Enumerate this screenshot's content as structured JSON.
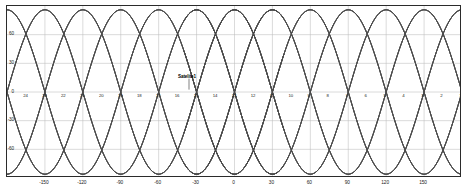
{
  "chart_data": {
    "type": "line",
    "title": "",
    "xlabel": "",
    "ylabel": "",
    "xlim": [
      -180,
      180
    ],
    "ylim": [
      -90,
      90
    ],
    "grid": true,
    "legend": "none",
    "x_ticks": [
      "-150",
      "-120",
      "-90",
      "-60",
      "-30",
      "0",
      "30",
      "60",
      "90",
      "120",
      "150"
    ],
    "x_tick_values": [
      -150,
      -120,
      -90,
      -60,
      -30,
      0,
      30,
      60,
      90,
      120,
      150
    ],
    "y_ticks": [
      "60",
      "30",
      "0",
      "-30",
      "-60"
    ],
    "y_tick_values": [
      60,
      30,
      0,
      -30,
      -60
    ],
    "series_description": "Satellite ground tracks: sinusoidal longitude-latitude traces of a walker constellation, amplitude 86 degrees latitude, ground-track period 360/12 degrees longitude per revolution",
    "series": [
      {
        "name": "track-1",
        "phase_deg": -180,
        "amplitude_deg": 86,
        "period_deg": 120,
        "direction": "ascending"
      },
      {
        "name": "track-2",
        "phase_deg": -150,
        "amplitude_deg": 86,
        "period_deg": 120,
        "direction": "ascending"
      },
      {
        "name": "track-3",
        "phase_deg": -120,
        "amplitude_deg": 86,
        "period_deg": 120,
        "direction": "ascending"
      },
      {
        "name": "track-4",
        "phase_deg": -90,
        "amplitude_deg": 86,
        "period_deg": 120,
        "direction": "ascending"
      },
      {
        "name": "track-5",
        "phase_deg": -60,
        "amplitude_deg": 86,
        "period_deg": 120,
        "direction": "ascending"
      },
      {
        "name": "track-6",
        "phase_deg": -30,
        "amplitude_deg": 86,
        "period_deg": 120,
        "direction": "ascending"
      },
      {
        "name": "track-7",
        "phase_deg": 0,
        "amplitude_deg": 86,
        "period_deg": 120,
        "direction": "ascending"
      },
      {
        "name": "track-8",
        "phase_deg": 30,
        "amplitude_deg": 86,
        "period_deg": 120,
        "direction": "ascending"
      },
      {
        "name": "track-9",
        "phase_deg": 60,
        "amplitude_deg": 86,
        "period_deg": 120,
        "direction": "ascending"
      },
      {
        "name": "track-10",
        "phase_deg": 90,
        "amplitude_deg": 86,
        "period_deg": 120,
        "direction": "ascending"
      },
      {
        "name": "track-11",
        "phase_deg": 120,
        "amplitude_deg": 86,
        "period_deg": 120,
        "direction": "ascending"
      },
      {
        "name": "track-12",
        "phase_deg": 150,
        "amplitude_deg": 86,
        "period_deg": 120,
        "direction": "ascending"
      }
    ],
    "satellite_markers": [
      {
        "label": "24",
        "x": -168,
        "y": 0
      },
      {
        "label": "23",
        "x": -153,
        "y": 0
      },
      {
        "label": "22",
        "x": -138,
        "y": 0
      },
      {
        "label": "21",
        "x": -123,
        "y": 0
      },
      {
        "label": "20",
        "x": -108,
        "y": 0
      },
      {
        "label": "19",
        "x": -93,
        "y": 0
      },
      {
        "label": "18",
        "x": -78,
        "y": 0
      },
      {
        "label": "17",
        "x": -63,
        "y": 0
      },
      {
        "label": "16",
        "x": -48,
        "y": 0
      },
      {
        "label": "15",
        "x": -33,
        "y": 0
      },
      {
        "label": "14",
        "x": -18,
        "y": 0
      },
      {
        "label": "13",
        "x": -3,
        "y": 0
      },
      {
        "label": "12",
        "x": 12,
        "y": 0
      },
      {
        "label": "11",
        "x": 27,
        "y": 0
      },
      {
        "label": "10",
        "x": 42,
        "y": 0
      },
      {
        "label": "9",
        "x": 57,
        "y": 0
      },
      {
        "label": "8",
        "x": 72,
        "y": 0
      },
      {
        "label": "7",
        "x": 87,
        "y": 0
      },
      {
        "label": "6",
        "x": 102,
        "y": 0
      },
      {
        "label": "5",
        "x": 117,
        "y": 0
      },
      {
        "label": "4",
        "x": 132,
        "y": 0
      },
      {
        "label": "3",
        "x": 147,
        "y": 0
      },
      {
        "label": "2",
        "x": 162,
        "y": 0
      },
      {
        "label": "1",
        "x": 177,
        "y": 0
      }
    ],
    "annotations": [
      {
        "name": "satellite-callout",
        "text": "Satelite1",
        "x": -36,
        "y": 14
      }
    ]
  },
  "colors": {
    "frame": "#2b2b2b",
    "grid": "#bdbdbd",
    "track": "#4a4a4a",
    "text": "#1a1a1a",
    "background": "#ffffff"
  },
  "caption": {
    "text": ""
  }
}
